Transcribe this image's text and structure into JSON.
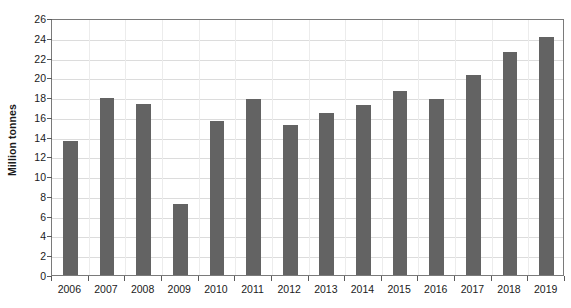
{
  "chart_data": {
    "type": "bar",
    "title": "",
    "subtitle": "",
    "xlabel": "",
    "ylabel": "Million tonnes",
    "categories": [
      "2006",
      "2007",
      "2008",
      "2009",
      "2010",
      "2011",
      "2012",
      "2013",
      "2014",
      "2015",
      "2016",
      "2017",
      "2018",
      "2019"
    ],
    "values": [
      13.6,
      17.9,
      17.3,
      7.2,
      15.6,
      17.8,
      15.2,
      16.4,
      17.2,
      18.6,
      17.8,
      20.2,
      22.6,
      24.1
    ],
    "series": [
      {
        "name": "Million tonnes",
        "values": [
          13.6,
          17.9,
          17.3,
          7.2,
          15.6,
          17.8,
          15.2,
          16.4,
          17.2,
          18.6,
          17.8,
          20.2,
          22.6,
          24.1
        ]
      }
    ],
    "ylim": [
      0,
      26
    ],
    "ytick_step": 2,
    "yticks": [
      0,
      2,
      4,
      6,
      8,
      10,
      12,
      14,
      16,
      18,
      20,
      22,
      24,
      26
    ],
    "ytick_labels": [
      "0",
      "2",
      "4",
      "6",
      "8",
      "10",
      "12",
      "14",
      "16",
      "18",
      "20",
      "22",
      "24",
      "26"
    ],
    "grid": true,
    "grid_axis": "y",
    "legend": false,
    "legend_position": "none",
    "bar_color": "#636363",
    "gridline_color": "#dcdcdc",
    "axis_color": "#7a7a7a",
    "text_color": "#1a1a1a",
    "background": "#ffffff",
    "annotations": []
  }
}
